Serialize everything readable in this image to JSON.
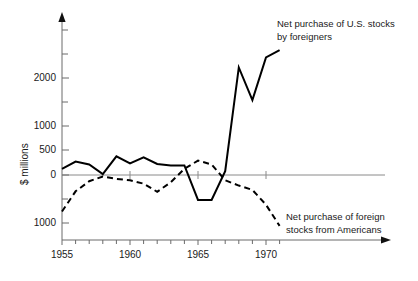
{
  "chart_data": {
    "type": "line",
    "title": "",
    "xlabel": "",
    "ylabel": "$ millions",
    "xlim": [
      1954.5,
      1972.2
    ],
    "ylim": [
      -1250,
      2600
    ],
    "grid": false,
    "legend_position": "inline-annotations",
    "x_ticks_major": [
      1955,
      1960,
      1965,
      1970
    ],
    "x_tick_labels": [
      "1955",
      "1960",
      "1965",
      "1970"
    ],
    "x_ticks_minor": [
      1956,
      1957,
      1958,
      1959,
      1961,
      1962,
      1963,
      1964,
      1966,
      1967,
      1968,
      1969,
      1971
    ],
    "y_ticks": [
      -1000,
      0,
      500,
      1000,
      1500,
      2000,
      2500
    ],
    "y_tick_labels": [
      "1000",
      "0",
      "500",
      "1000",
      "",
      "2000",
      ""
    ],
    "zero_line": 0,
    "series": [
      {
        "name": "Net purchase of U.S. stocks by foreigners",
        "style": "solid",
        "color": "#000000",
        "x": [
          1955,
          1956,
          1957,
          1958,
          1959,
          1960,
          1961,
          1962,
          1963,
          1964,
          1965,
          1966,
          1967,
          1968,
          1969,
          1970,
          1971
        ],
        "values": [
          130,
          280,
          220,
          20,
          390,
          240,
          370,
          230,
          200,
          200,
          -520,
          -520,
          80,
          2240,
          1560,
          2450,
          2600
        ]
      },
      {
        "name": "Net purchase of foreign stocks from Americans",
        "style": "dashed",
        "color": "#000000",
        "x": [
          1955,
          1956,
          1957,
          1958,
          1959,
          1960,
          1961,
          1962,
          1963,
          1964,
          1965,
          1966,
          1967,
          1968,
          1969,
          1970,
          1971
        ],
        "values": [
          -760,
          -340,
          -130,
          -30,
          -80,
          -110,
          -180,
          -350,
          -150,
          130,
          300,
          220,
          -110,
          -220,
          -310,
          -620,
          -1060
        ]
      }
    ],
    "annotations": [
      {
        "name": "us-stocks-annotation",
        "line1": "Net purchase of U.S. stocks",
        "line2": "by foreigners"
      },
      {
        "name": "foreign-stocks-annotation",
        "line1": "Net purchase of foreign",
        "line2": "stocks from Americans"
      }
    ]
  },
  "axis": {
    "y_title": "$ millions"
  }
}
